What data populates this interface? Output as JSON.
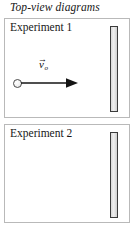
{
  "title": "Top-view diagrams",
  "panels": [
    {
      "label": "Experiment 1",
      "velocity_symbol": "v",
      "velocity_subscript": "o",
      "velocity_vector_accent": "→",
      "object": "puck-circle",
      "barrier": "vertical-wall"
    },
    {
      "label": "Experiment 2",
      "velocity_symbol": "v",
      "velocity_subscript": "o",
      "velocity_vector_accent": "→",
      "object": "puck-circle",
      "barrier": "vertical-wall"
    }
  ],
  "colors": {
    "ink": "#1a1a1a",
    "panel_border": "#b9b9b9",
    "wall_outline": "#3b3b3b",
    "wall_fill": "#dcdcdc",
    "arrow": "#141414",
    "puck_outline": "#4a4a4a"
  }
}
